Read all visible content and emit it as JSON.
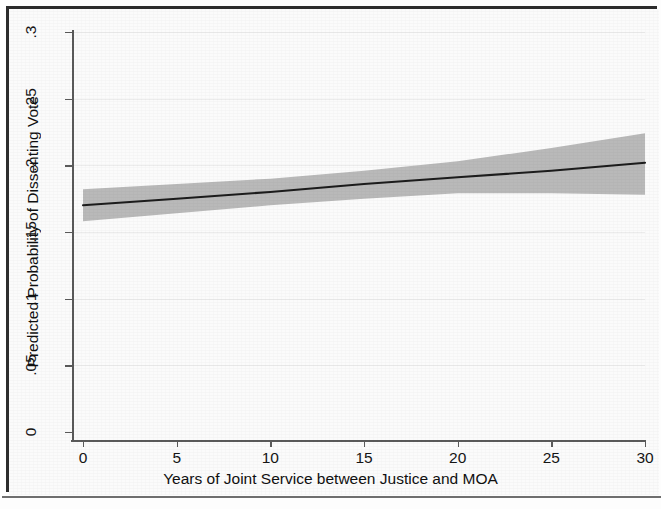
{
  "figure": {
    "background_color": "#fbfbfb",
    "frame_color": "#2b2b2b",
    "band_color": "#b9b9b9",
    "line_color": "#1c1c1c",
    "grid_color": "#ececec",
    "axis_color": "#5a5a5a"
  },
  "axes": {
    "x_title": "Years of Joint Service between Justice and MOA",
    "y_title": "Predicted Probability of Dissenting Vote",
    "x_ticks": [
      "0",
      "5",
      "10",
      "15",
      "20",
      "25",
      "30"
    ],
    "y_ticks": [
      "0",
      ".05",
      ".1",
      ".15",
      ".2",
      ".25",
      ".3"
    ]
  },
  "chart_data": {
    "type": "line",
    "title": "",
    "subtitle": "",
    "xlabel": "Years of Joint Service between Justice and MOA",
    "ylabel": "Predicted Probability of Dissenting Vote",
    "xlim": [
      0,
      30
    ],
    "ylim": [
      0,
      0.3
    ],
    "xticks": [
      0,
      5,
      10,
      15,
      20,
      25,
      30
    ],
    "yticks": [
      0,
      0.05,
      0.1,
      0.15,
      0.2,
      0.25,
      0.3
    ],
    "xtick_labels": [
      "0",
      "5",
      "10",
      "15",
      "20",
      "25",
      "30"
    ],
    "ytick_labels": [
      "0",
      ".05",
      ".1",
      ".15",
      ".2",
      ".25",
      ".3"
    ],
    "grid": "horizontal-faint",
    "legend": "none",
    "x": [
      0,
      5,
      10,
      15,
      20,
      25,
      30
    ],
    "series": [
      {
        "name": "Predicted probability",
        "kind": "line",
        "values": [
          0.17,
          0.175,
          0.18,
          0.186,
          0.191,
          0.196,
          0.202
        ]
      },
      {
        "name": "95% confidence interval upper",
        "kind": "band-upper",
        "values": [
          0.182,
          0.186,
          0.19,
          0.196,
          0.203,
          0.213,
          0.224
        ]
      },
      {
        "name": "95% confidence interval lower",
        "kind": "band-lower",
        "values": [
          0.158,
          0.164,
          0.17,
          0.175,
          0.179,
          0.179,
          0.178
        ]
      }
    ],
    "annotations": []
  }
}
